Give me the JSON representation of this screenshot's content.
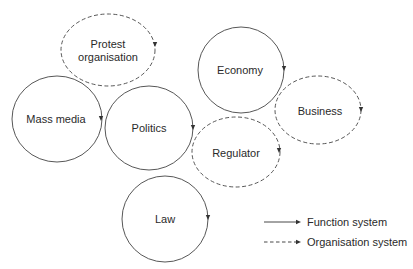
{
  "diagram": {
    "type": "system-relations",
    "nodes": [
      {
        "id": "protest",
        "label_lines": [
          "Protest",
          "organisation"
        ],
        "kind": "organisation",
        "cx": 108,
        "cy": 50,
        "rx": 47,
        "ry": 36
      },
      {
        "id": "economy",
        "label": "Economy",
        "kind": "function",
        "cx": 241,
        "cy": 70,
        "rx": 43,
        "ry": 43
      },
      {
        "id": "mass-media",
        "label": "Mass media",
        "kind": "function",
        "cx": 57,
        "cy": 119,
        "rx": 45,
        "ry": 43
      },
      {
        "id": "politics",
        "label": "Politics",
        "kind": "function",
        "cx": 149,
        "cy": 128,
        "rx": 44,
        "ry": 42
      },
      {
        "id": "business",
        "label": "Business",
        "kind": "organisation",
        "cx": 318,
        "cy": 110,
        "rx": 43,
        "ry": 34
      },
      {
        "id": "regulator",
        "label": "Regulator",
        "kind": "organisation",
        "cx": 236,
        "cy": 152,
        "rx": 44,
        "ry": 35
      },
      {
        "id": "law",
        "label": "Law",
        "kind": "function",
        "cx": 165,
        "cy": 219,
        "rx": 43,
        "ry": 43
      }
    ],
    "legend": [
      {
        "kind": "function",
        "label": "Function system",
        "style": "solid"
      },
      {
        "kind": "organisation",
        "label": "Organisation system",
        "style": "dashed"
      }
    ],
    "colors": {
      "stroke": "#333333",
      "text": "#2a2a2a",
      "background": "#ffffff"
    }
  }
}
